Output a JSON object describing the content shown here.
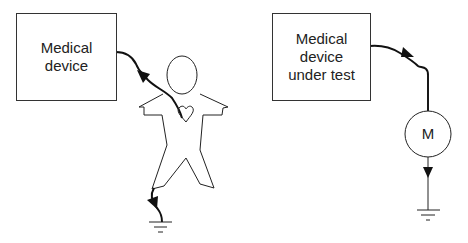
{
  "diagram": {
    "left": {
      "device_box": {
        "label_line1": "Medical",
        "label_line2": "device"
      },
      "figure": "human-body-with-heart",
      "current_path": [
        "device",
        "heart",
        "foot",
        "ground"
      ]
    },
    "right": {
      "device_box": {
        "label_line1": "Medical",
        "label_line2": "device",
        "label_line3": "under test"
      },
      "meter": {
        "label": "M"
      },
      "current_path": [
        "device",
        "meter",
        "ground"
      ]
    },
    "colors": {
      "stroke": "#222222",
      "background": "#ffffff"
    }
  }
}
